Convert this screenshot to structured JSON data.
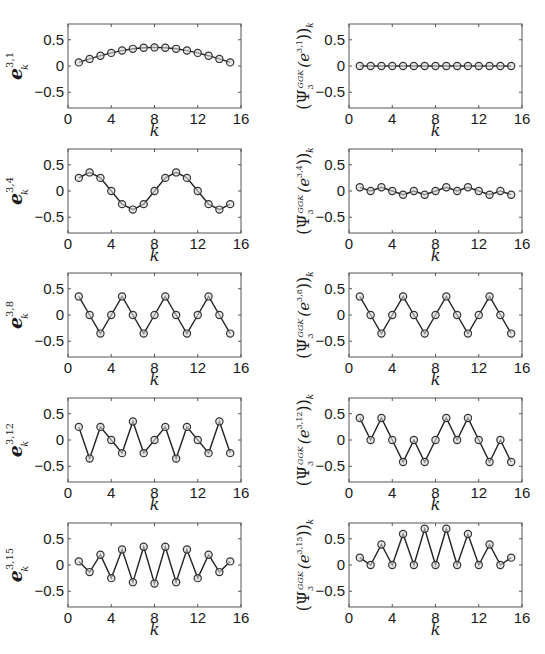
{
  "chart_data": [
    {
      "type": "line",
      "panel": "row1-left",
      "ylabel": "e_k^{3,1}",
      "ylabel_main": "e",
      "ylabel_sup": "3,1",
      "ylabel_sub": "k",
      "xlabel": "k",
      "xlim": [
        0,
        16
      ],
      "ylim": [
        -0.8,
        0.8
      ],
      "xticks": [
        0,
        4,
        8,
        12,
        16
      ],
      "yticks": [
        -0.5,
        0,
        0.5
      ],
      "x": [
        1,
        2,
        3,
        4,
        5,
        6,
        7,
        8,
        9,
        10,
        11,
        12,
        13,
        14,
        15
      ],
      "values": [
        0.069,
        0.135,
        0.196,
        0.25,
        0.294,
        0.327,
        0.347,
        0.354,
        0.347,
        0.327,
        0.294,
        0.25,
        0.196,
        0.135,
        0.069
      ]
    },
    {
      "type": "line",
      "panel": "row1-right",
      "ylabel": "(Psi_3^{GGK}(e^{3,1}))_k",
      "ylabel_sup": "3,1",
      "xlabel": "k",
      "xlim": [
        0,
        16
      ],
      "ylim": [
        -0.8,
        0.8
      ],
      "xticks": [
        0,
        4,
        8,
        12,
        16
      ],
      "yticks": [
        -0.5,
        0,
        0.5
      ],
      "x": [
        1,
        2,
        3,
        4,
        5,
        6,
        7,
        8,
        9,
        10,
        11,
        12,
        13,
        14,
        15
      ],
      "values": [
        0,
        0,
        0,
        0,
        0,
        0,
        0,
        0,
        0,
        0,
        0,
        0,
        0,
        0,
        0
      ]
    },
    {
      "type": "line",
      "panel": "row2-left",
      "ylabel": "e_k^{3,4}",
      "ylabel_main": "e",
      "ylabel_sup": "3,4",
      "ylabel_sub": "k",
      "xlabel": "k",
      "xlim": [
        0,
        16
      ],
      "ylim": [
        -0.8,
        0.8
      ],
      "xticks": [
        0,
        4,
        8,
        12,
        16
      ],
      "yticks": [
        -0.5,
        0,
        0.5
      ],
      "x": [
        1,
        2,
        3,
        4,
        5,
        6,
        7,
        8,
        9,
        10,
        11,
        12,
        13,
        14,
        15
      ],
      "values": [
        0.25,
        0.354,
        0.25,
        0,
        -0.25,
        -0.354,
        -0.25,
        0,
        0.25,
        0.354,
        0.25,
        0,
        -0.25,
        -0.354,
        -0.25
      ]
    },
    {
      "type": "line",
      "panel": "row2-right",
      "ylabel": "(Psi_3^{GGK}(e^{3,4}))_k",
      "ylabel_sup": "3,4",
      "xlabel": "k",
      "xlim": [
        0,
        16
      ],
      "ylim": [
        -0.8,
        0.8
      ],
      "xticks": [
        0,
        4,
        8,
        12,
        16
      ],
      "yticks": [
        -0.5,
        0,
        0.5
      ],
      "x": [
        1,
        2,
        3,
        4,
        5,
        6,
        7,
        8,
        9,
        10,
        11,
        12,
        13,
        14,
        15
      ],
      "values": [
        0.07,
        0,
        0.07,
        0,
        -0.07,
        0,
        -0.07,
        0,
        0.07,
        0,
        0.07,
        0,
        -0.07,
        0,
        -0.07
      ]
    },
    {
      "type": "line",
      "panel": "row3-left",
      "ylabel": "e_k^{3,8}",
      "ylabel_main": "e",
      "ylabel_sup": "3,8",
      "ylabel_sub": "k",
      "xlabel": "k",
      "xlim": [
        0,
        16
      ],
      "ylim": [
        -0.8,
        0.8
      ],
      "xticks": [
        0,
        4,
        8,
        12,
        16
      ],
      "yticks": [
        -0.5,
        0,
        0.5
      ],
      "x": [
        1,
        2,
        3,
        4,
        5,
        6,
        7,
        8,
        9,
        10,
        11,
        12,
        13,
        14,
        15
      ],
      "values": [
        0.354,
        0,
        -0.354,
        0,
        0.354,
        0,
        -0.354,
        0,
        0.354,
        0,
        -0.354,
        0,
        0.354,
        0,
        -0.354
      ]
    },
    {
      "type": "line",
      "panel": "row3-right",
      "ylabel": "(Psi_3^{GGK}(e^{3,8}))_k",
      "ylabel_sup": "3,8",
      "xlabel": "k",
      "xlim": [
        0,
        16
      ],
      "ylim": [
        -0.8,
        0.8
      ],
      "xticks": [
        0,
        4,
        8,
        12,
        16
      ],
      "yticks": [
        -0.5,
        0,
        0.5
      ],
      "x": [
        1,
        2,
        3,
        4,
        5,
        6,
        7,
        8,
        9,
        10,
        11,
        12,
        13,
        14,
        15
      ],
      "values": [
        0.354,
        0,
        -0.354,
        0,
        0.354,
        0,
        -0.354,
        0,
        0.354,
        0,
        -0.354,
        0,
        0.354,
        0,
        -0.354
      ]
    },
    {
      "type": "line",
      "panel": "row4-left",
      "ylabel": "e_k^{3,12}",
      "ylabel_main": "e",
      "ylabel_sup": "3,12",
      "ylabel_sub": "k",
      "xlabel": "k",
      "xlim": [
        0,
        16
      ],
      "ylim": [
        -0.8,
        0.8
      ],
      "xticks": [
        0,
        4,
        8,
        12,
        16
      ],
      "yticks": [
        -0.5,
        0,
        0.5
      ],
      "x": [
        1,
        2,
        3,
        4,
        5,
        6,
        7,
        8,
        9,
        10,
        11,
        12,
        13,
        14,
        15
      ],
      "values": [
        0.25,
        -0.354,
        0.25,
        0,
        -0.25,
        0.354,
        -0.25,
        0,
        0.25,
        -0.354,
        0.25,
        0,
        -0.25,
        0.354,
        -0.25
      ]
    },
    {
      "type": "line",
      "panel": "row4-right",
      "ylabel": "(Psi_3^{GGK}(e^{3,12}))_k",
      "ylabel_sup": "3,12",
      "xlabel": "k",
      "xlim": [
        0,
        16
      ],
      "ylim": [
        -0.8,
        0.8
      ],
      "xticks": [
        0,
        4,
        8,
        12,
        16
      ],
      "yticks": [
        -0.5,
        0,
        0.5
      ],
      "x": [
        1,
        2,
        3,
        4,
        5,
        6,
        7,
        8,
        9,
        10,
        11,
        12,
        13,
        14,
        15
      ],
      "values": [
        0.42,
        0,
        0.42,
        0,
        -0.42,
        0,
        -0.42,
        0,
        0.42,
        0,
        0.42,
        0,
        -0.42,
        0,
        -0.42
      ]
    },
    {
      "type": "line",
      "panel": "row5-left",
      "ylabel": "e_k^{3,15}",
      "ylabel_main": "e",
      "ylabel_sup": "3,15",
      "ylabel_sub": "k",
      "xlabel": "k",
      "xlim": [
        0,
        16
      ],
      "ylim": [
        -0.8,
        0.8
      ],
      "xticks": [
        0,
        4,
        8,
        12,
        16
      ],
      "yticks": [
        -0.5,
        0,
        0.5
      ],
      "x": [
        1,
        2,
        3,
        4,
        5,
        6,
        7,
        8,
        9,
        10,
        11,
        12,
        13,
        14,
        15
      ],
      "values": [
        0.069,
        -0.135,
        0.196,
        -0.25,
        0.294,
        -0.327,
        0.347,
        -0.354,
        0.347,
        -0.327,
        0.294,
        -0.25,
        0.196,
        -0.135,
        0.069
      ]
    },
    {
      "type": "line",
      "panel": "row5-right",
      "ylabel": "(Psi_3^{GGK}(e^{3,15}))_k",
      "ylabel_sup": "3,15",
      "xlabel": "k",
      "xlim": [
        0,
        16
      ],
      "ylim": [
        -0.8,
        0.8
      ],
      "xticks": [
        0,
        4,
        8,
        12,
        16
      ],
      "yticks": [
        -0.5,
        0,
        0.5
      ],
      "x": [
        1,
        2,
        3,
        4,
        5,
        6,
        7,
        8,
        9,
        10,
        11,
        12,
        13,
        14,
        15
      ],
      "values": [
        0.14,
        0,
        0.39,
        0,
        0.59,
        0,
        0.69,
        0,
        0.69,
        0,
        0.59,
        0,
        0.39,
        0,
        0.14
      ]
    }
  ],
  "style": {
    "line_color": "#222222",
    "marker_color": "#333333",
    "axis_color": "#555555",
    "background": "#ffffff"
  },
  "tick_labels": {
    "x": [
      "0",
      "4",
      "8",
      "12",
      "16"
    ],
    "y": [
      "0.5",
      "0",
      "−0.5"
    ]
  },
  "xlabel_text": "k",
  "right_ylabel_parts": {
    "open": "(Ψ",
    "sub": "3",
    "sup": "GGK",
    "mid": "(e",
    "close": "))",
    "outer_sub": "k"
  }
}
